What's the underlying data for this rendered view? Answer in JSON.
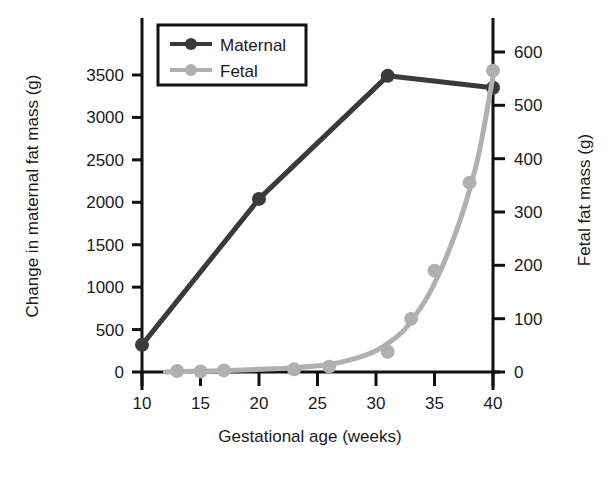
{
  "chart_data": {
    "type": "scatter",
    "title": "",
    "xlabel": "Gestational age (weeks)",
    "ylabel": "Change in maternal fat mass (g)",
    "y2label": "Fetal fat mass (g)",
    "xlim": [
      10,
      40
    ],
    "ylim": [
      0,
      3750
    ],
    "y2lim": [
      0,
      625
    ],
    "grid": false,
    "legend_position": "top-left-inside",
    "xticks": [
      "10",
      "15",
      "20",
      "25",
      "30",
      "35",
      "40"
    ],
    "xtick_values": [
      10,
      15,
      20,
      25,
      30,
      35,
      40
    ],
    "yticks": [
      "0",
      "500",
      "1000",
      "1500",
      "2000",
      "2500",
      "3000",
      "3500"
    ],
    "ytick_values": [
      0,
      500,
      1000,
      1500,
      2000,
      2500,
      3000,
      3500
    ],
    "y2ticks": [
      "0",
      "100",
      "200",
      "300",
      "400",
      "500",
      "600"
    ],
    "y2tick_values": [
      0,
      100,
      200,
      300,
      400,
      500,
      600
    ],
    "series": [
      {
        "name": "Maternal",
        "axis": "left",
        "color": "#3a3a3a",
        "marker": "circle",
        "line": true,
        "points": [
          {
            "x": 10,
            "y": 320
          },
          {
            "x": 20,
            "y": 2040
          },
          {
            "x": 31,
            "y": 3490
          },
          {
            "x": 40,
            "y": 3350
          }
        ]
      },
      {
        "name": "Fetal",
        "axis": "right",
        "color": "#b0b0b0",
        "marker": "circle",
        "line": false,
        "fit_curve": true,
        "points": [
          {
            "x": 13,
            "y": 2
          },
          {
            "x": 15,
            "y": 1
          },
          {
            "x": 17,
            "y": 3
          },
          {
            "x": 23,
            "y": 5
          },
          {
            "x": 26,
            "y": 10
          },
          {
            "x": 31,
            "y": 38
          },
          {
            "x": 33,
            "y": 100
          },
          {
            "x": 35,
            "y": 190
          },
          {
            "x": 38,
            "y": 355
          },
          {
            "x": 40,
            "y": 565
          }
        ],
        "fit_points": [
          {
            "x": 12.0,
            "y": 0
          },
          {
            "x": 16.0,
            "y": 2
          },
          {
            "x": 20.0,
            "y": 5
          },
          {
            "x": 23.0,
            "y": 8
          },
          {
            "x": 26.0,
            "y": 14
          },
          {
            "x": 28.0,
            "y": 24
          },
          {
            "x": 30.0,
            "y": 40
          },
          {
            "x": 32.0,
            "y": 70
          },
          {
            "x": 33.0,
            "y": 95
          },
          {
            "x": 34.5,
            "y": 145
          },
          {
            "x": 36.0,
            "y": 215
          },
          {
            "x": 37.5,
            "y": 305
          },
          {
            "x": 38.8,
            "y": 410
          },
          {
            "x": 40.0,
            "y": 555
          }
        ]
      }
    ]
  },
  "legend": {
    "entries": [
      {
        "label": "Maternal",
        "color": "#3a3a3a"
      },
      {
        "label": "Fetal",
        "color": "#b0b0b0"
      }
    ]
  }
}
